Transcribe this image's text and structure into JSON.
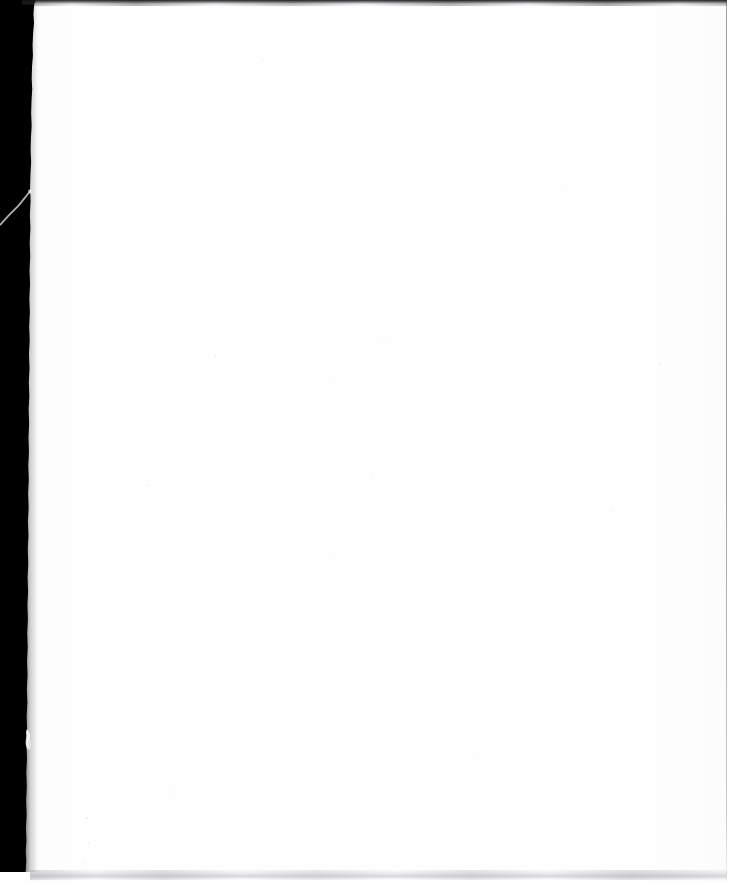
{
  "document": {
    "kind": "scanned-page",
    "page_state": "blank",
    "width": 735,
    "height": 883,
    "visible_text": "",
    "caption": ""
  },
  "colors": {
    "paper": "#fefeff",
    "gutter": "#000000",
    "top_edge": "#16161a",
    "bottom_edge": "#a8a8af",
    "right_rule": "#808088",
    "backdrop": "#ffffff"
  },
  "regions": {
    "gutter": {
      "name": "left-scan-gutter",
      "x": 0,
      "y": 0,
      "width": 36,
      "height": 872
    },
    "paper": {
      "name": "page-body",
      "x": 30,
      "y": 4,
      "width": 696,
      "height": 872
    },
    "top_edge": {
      "name": "top-edge-band",
      "x": 22,
      "y": 0,
      "width": 713,
      "height": 5
    },
    "bottom_edge": {
      "name": "bottom-edge-smudge",
      "x": 30,
      "y": 870,
      "width": 700,
      "height": 9
    },
    "right_rule": {
      "name": "right-edge-rule",
      "x": 726,
      "y": 2,
      "width": 1,
      "height": 879
    }
  },
  "artifacts": [
    {
      "name": "crease-streak",
      "x": 0,
      "y": 188,
      "width": 40,
      "height": 40
    },
    {
      "name": "tear-notch",
      "x": 22,
      "y": 728,
      "width": 14,
      "height": 24
    }
  ],
  "specks": [
    {
      "x": 214,
      "y": 355,
      "size": 2.0,
      "opacity": 0.09
    },
    {
      "x": 383,
      "y": 339,
      "size": 1.6,
      "opacity": 0.07
    },
    {
      "x": 334,
      "y": 376,
      "size": 1.4,
      "opacity": 0.06
    },
    {
      "x": 440,
      "y": 364,
      "size": 1.2,
      "opacity": 0.05
    },
    {
      "x": 148,
      "y": 484,
      "size": 2.2,
      "opacity": 0.1
    },
    {
      "x": 371,
      "y": 476,
      "size": 1.5,
      "opacity": 0.07
    },
    {
      "x": 334,
      "y": 556,
      "size": 1.3,
      "opacity": 0.06
    },
    {
      "x": 659,
      "y": 363,
      "size": 1.8,
      "opacity": 0.08
    },
    {
      "x": 612,
      "y": 509,
      "size": 1.5,
      "opacity": 0.07
    },
    {
      "x": 697,
      "y": 422,
      "size": 1.2,
      "opacity": 0.05
    },
    {
      "x": 565,
      "y": 186,
      "size": 1.4,
      "opacity": 0.06
    },
    {
      "x": 547,
      "y": 112,
      "size": 1.3,
      "opacity": 0.05
    },
    {
      "x": 262,
      "y": 59,
      "size": 1.5,
      "opacity": 0.06
    },
    {
      "x": 86,
      "y": 817,
      "size": 2.4,
      "opacity": 0.11
    },
    {
      "x": 88,
      "y": 842,
      "size": 2.0,
      "opacity": 0.09
    },
    {
      "x": 84,
      "y": 861,
      "size": 1.7,
      "opacity": 0.08
    },
    {
      "x": 172,
      "y": 791,
      "size": 1.6,
      "opacity": 0.07
    },
    {
      "x": 381,
      "y": 906,
      "size": 1.3,
      "opacity": 0.05
    },
    {
      "x": 478,
      "y": 755,
      "size": 1.4,
      "opacity": 0.06
    },
    {
      "x": 246,
      "y": 672,
      "size": 1.3,
      "opacity": 0.05
    },
    {
      "x": 612,
      "y": 651,
      "size": 1.2,
      "opacity": 0.05
    },
    {
      "x": 700,
      "y": 743,
      "size": 1.4,
      "opacity": 0.06
    },
    {
      "x": 455,
      "y": 206,
      "size": 1.2,
      "opacity": 0.05
    },
    {
      "x": 129,
      "y": 640,
      "size": 1.3,
      "opacity": 0.05
    }
  ]
}
